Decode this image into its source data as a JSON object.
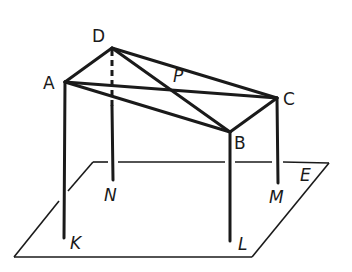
{
  "diagram": {
    "type": "3D geometry figure: rectangular table frame above a plane",
    "points": {
      "A": {
        "label": "A",
        "x": 65,
        "y": 82
      },
      "B": {
        "label": "B",
        "x": 230,
        "y": 132
      },
      "C": {
        "label": "C",
        "x": 277,
        "y": 98
      },
      "D": {
        "label": "D",
        "x": 112,
        "y": 48
      },
      "P": {
        "label": "P",
        "x": 176,
        "y": 91
      },
      "K": {
        "label": "K",
        "x": 64,
        "y": 238
      },
      "L": {
        "label": "L",
        "x": 230,
        "y": 241
      },
      "M": {
        "label": "M",
        "x": 278,
        "y": 183
      },
      "N": {
        "label": "N",
        "x": 113,
        "y": 180
      },
      "E": {
        "label": "E"
      }
    },
    "labels": {
      "A": "A",
      "B": "B",
      "C": "C",
      "D": "D",
      "P": "P",
      "K": "K",
      "L": "L",
      "M": "M",
      "N": "N",
      "E": "E"
    },
    "segments": [
      "AD",
      "DC",
      "CB",
      "BA",
      "AC",
      "DB",
      "AK",
      "BL",
      "CM",
      "DN"
    ],
    "hidden_segment": "DN (upper part dashed)",
    "plane": {
      "name": "E",
      "corners": [
        [
          14,
          257
        ],
        [
          252,
          257
        ],
        [
          329,
          163
        ],
        [
          93,
          162
        ]
      ]
    }
  }
}
